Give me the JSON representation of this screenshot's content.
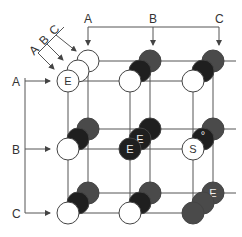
{
  "diagram": {
    "colors": {
      "white": "#ffffff",
      "black": "#1f1f1f",
      "gray": "#4a4a4a",
      "line": "#555555",
      "stroke": "#444444"
    },
    "top_labels": [
      "A",
      "B",
      "C"
    ],
    "left_labels": [
      "A",
      "B",
      "C"
    ],
    "depth_labels": [
      "A",
      "B",
      "C"
    ],
    "cells": [
      {
        "row": "A",
        "col": "A",
        "stack": [
          {
            "fill": "white",
            "label": "E"
          },
          {
            "fill": "white",
            "label": ""
          },
          {
            "fill": "white",
            "label": ""
          }
        ]
      },
      {
        "row": "A",
        "col": "B",
        "stack": [
          {
            "fill": "white",
            "label": ""
          },
          {
            "fill": "black",
            "label": ""
          },
          {
            "fill": "gray",
            "label": ""
          }
        ]
      },
      {
        "row": "A",
        "col": "C",
        "stack": [
          {
            "fill": "white",
            "label": ""
          },
          {
            "fill": "black",
            "label": ""
          },
          {
            "fill": "gray",
            "label": ""
          }
        ]
      },
      {
        "row": "B",
        "col": "A",
        "stack": [
          {
            "fill": "white",
            "label": ""
          },
          {
            "fill": "black",
            "label": ""
          },
          {
            "fill": "gray",
            "label": ""
          }
        ]
      },
      {
        "row": "B",
        "col": "B",
        "stack": [
          {
            "fill": "black",
            "label": "E"
          },
          {
            "fill": "black",
            "label": "E"
          },
          {
            "fill": "black",
            "label": ""
          }
        ]
      },
      {
        "row": "B",
        "col": "C",
        "stack": [
          {
            "fill": "white",
            "label": "S"
          },
          {
            "fill": "black",
            "label": "°"
          },
          {
            "fill": "gray",
            "label": ""
          }
        ]
      },
      {
        "row": "C",
        "col": "A",
        "stack": [
          {
            "fill": "white",
            "label": ""
          },
          {
            "fill": "black",
            "label": ""
          },
          {
            "fill": "gray",
            "label": ""
          }
        ]
      },
      {
        "row": "C",
        "col": "B",
        "stack": [
          {
            "fill": "white",
            "label": ""
          },
          {
            "fill": "black",
            "label": ""
          },
          {
            "fill": "gray",
            "label": ""
          }
        ]
      },
      {
        "row": "C",
        "col": "C",
        "stack": [
          {
            "fill": "gray",
            "label": ""
          },
          {
            "fill": "gray",
            "label": ""
          },
          {
            "fill": "gray",
            "label": "E"
          }
        ]
      }
    ]
  }
}
